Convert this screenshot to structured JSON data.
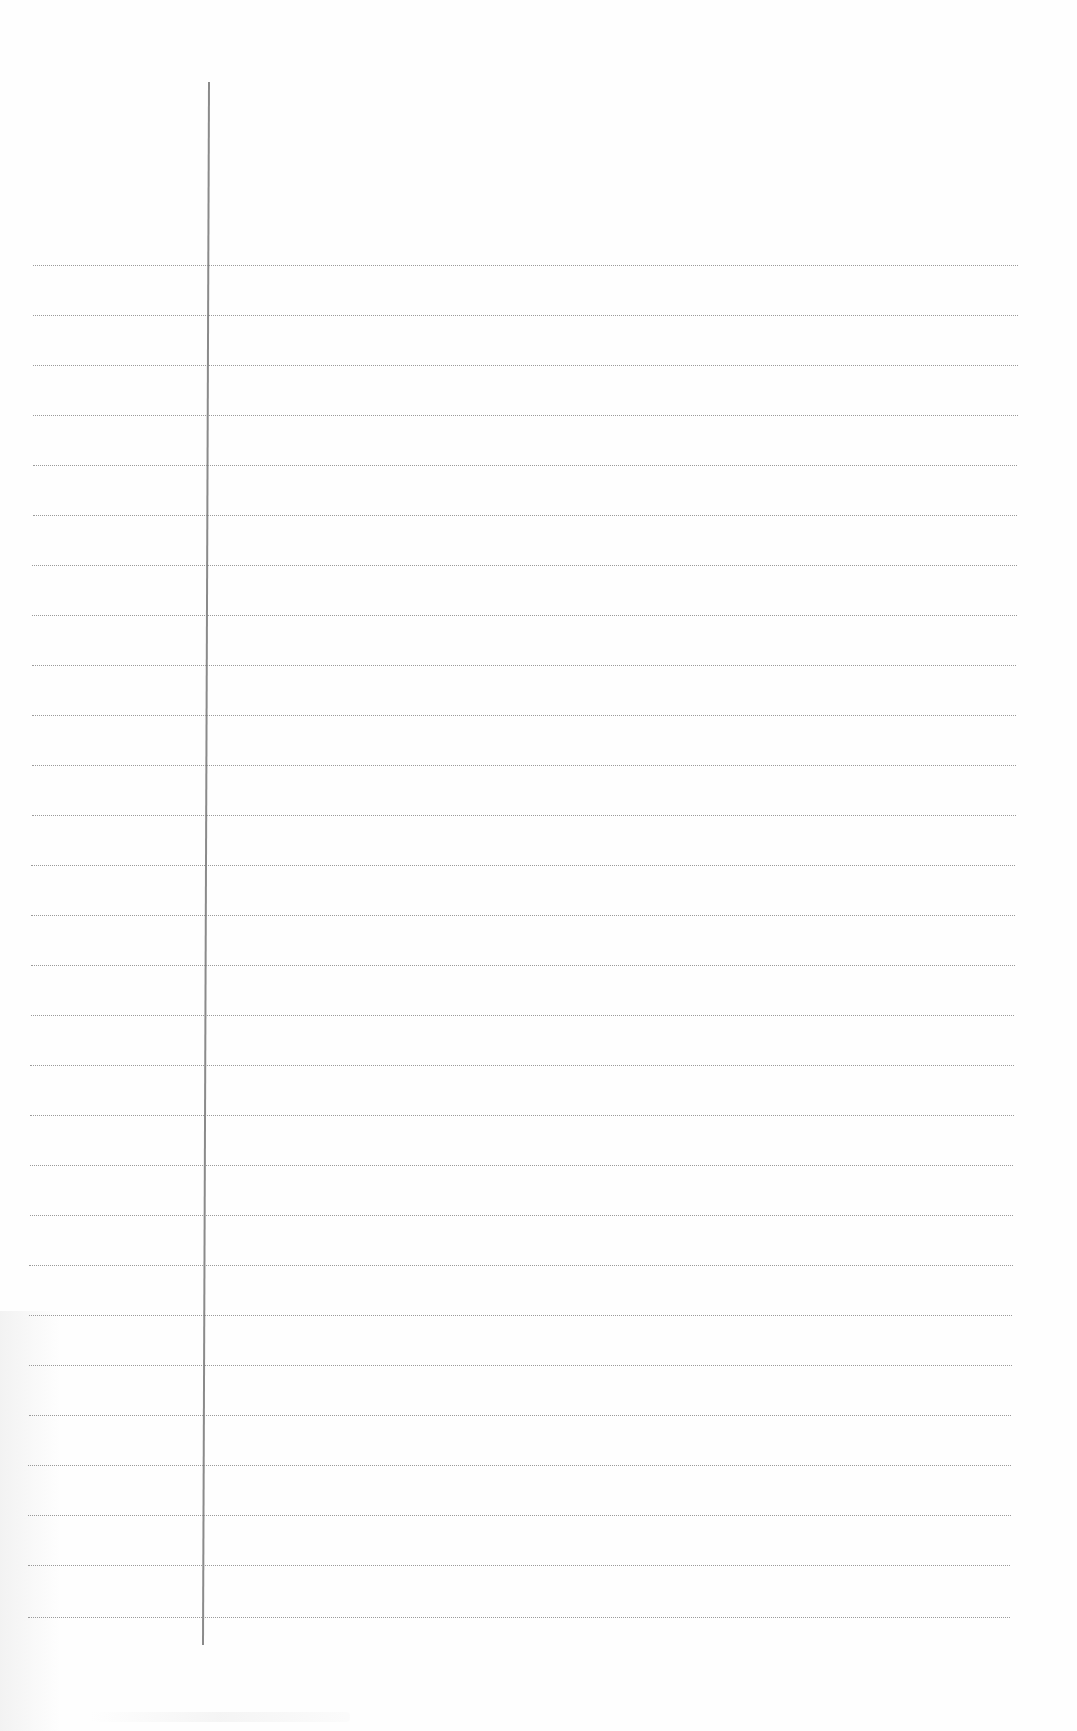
{
  "page": {
    "type": "blank-ruled-notebook-page",
    "background_color": "#fefefe",
    "rule_color": "#9a9a9a",
    "margin_color": "#8a8a8a",
    "rule_count": 28,
    "rule_spacing_px": 50,
    "first_rule_y": 265,
    "content_text": ""
  },
  "rules": [
    {
      "y": 265,
      "x1": 33,
      "x2": 1018
    },
    {
      "y": 315,
      "x1": 33,
      "x2": 1018
    },
    {
      "y": 365,
      "x1": 33,
      "x2": 1018
    },
    {
      "y": 415,
      "x1": 33,
      "x2": 1018
    },
    {
      "y": 465,
      "x1": 33,
      "x2": 1017
    },
    {
      "y": 515,
      "x1": 33,
      "x2": 1017
    },
    {
      "y": 565,
      "x1": 32,
      "x2": 1017
    },
    {
      "y": 615,
      "x1": 32,
      "x2": 1017
    },
    {
      "y": 665,
      "x1": 32,
      "x2": 1016
    },
    {
      "y": 715,
      "x1": 32,
      "x2": 1016
    },
    {
      "y": 765,
      "x1": 32,
      "x2": 1016
    },
    {
      "y": 815,
      "x1": 32,
      "x2": 1016
    },
    {
      "y": 865,
      "x1": 31,
      "x2": 1015
    },
    {
      "y": 915,
      "x1": 31,
      "x2": 1015
    },
    {
      "y": 965,
      "x1": 31,
      "x2": 1015
    },
    {
      "y": 1015,
      "x1": 31,
      "x2": 1014
    },
    {
      "y": 1065,
      "x1": 30,
      "x2": 1014
    },
    {
      "y": 1115,
      "x1": 30,
      "x2": 1014
    },
    {
      "y": 1165,
      "x1": 30,
      "x2": 1013
    },
    {
      "y": 1215,
      "x1": 30,
      "x2": 1013
    },
    {
      "y": 1265,
      "x1": 29,
      "x2": 1013
    },
    {
      "y": 1315,
      "x1": 29,
      "x2": 1012
    },
    {
      "y": 1365,
      "x1": 29,
      "x2": 1012
    },
    {
      "y": 1415,
      "x1": 29,
      "x2": 1011
    },
    {
      "y": 1465,
      "x1": 28,
      "x2": 1011
    },
    {
      "y": 1515,
      "x1": 28,
      "x2": 1011
    },
    {
      "y": 1565,
      "x1": 28,
      "x2": 1010
    },
    {
      "y": 1617,
      "x1": 28,
      "x2": 1010
    }
  ],
  "margin": {
    "x_top": 208,
    "y_top": 82,
    "x_bottom": 202,
    "y_bottom": 1645
  }
}
